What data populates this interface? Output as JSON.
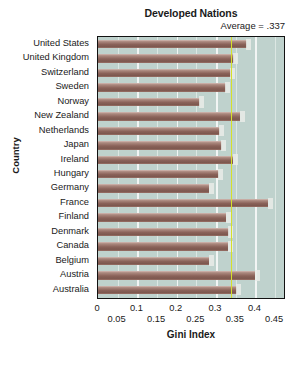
{
  "chart_data": {
    "type": "bar",
    "orientation": "horizontal",
    "title": "Developed Nations",
    "annotation": "Average = .337",
    "average_value": 0.337,
    "xlabel": "Gini Index",
    "ylabel": "Country",
    "xlim": [
      0,
      0.47
    ],
    "grid": true,
    "legend": null,
    "xticks_top": [
      "0",
      "0.1",
      "0.2",
      "0.3",
      "0.4"
    ],
    "xticks_top_values": [
      0,
      0.1,
      0.2,
      0.3,
      0.4
    ],
    "xticks_bottom": [
      "0.05",
      "0.15",
      "0.25",
      "0.35",
      "0.45"
    ],
    "xticks_bottom_values": [
      0.05,
      0.15,
      0.25,
      0.35,
      0.45
    ],
    "categories": [
      "United States",
      "United Kingdom",
      "Switzerland",
      "Sweden",
      "Norway",
      "New Zealand",
      "Netherlands",
      "Japan",
      "Ireland",
      "Hungary",
      "Germany",
      "France",
      "Finland",
      "Denmark",
      "Canada",
      "Belgium",
      "Austria",
      "Australia"
    ],
    "values": [
      0.378,
      0.345,
      0.337,
      0.325,
      0.258,
      0.362,
      0.309,
      0.314,
      0.343,
      0.307,
      0.283,
      0.432,
      0.326,
      0.332,
      0.331,
      0.283,
      0.4,
      0.352
    ]
  },
  "colors": {
    "bar": "#8a6259",
    "bar_highlight": "#c8aaa1",
    "plot_background": "#bfd2cd",
    "gridline": "#f4f7f5",
    "average_line": "#d4e02a",
    "frame": "#121212",
    "text": "#1a1a1a",
    "page_background": "#ffffff"
  }
}
